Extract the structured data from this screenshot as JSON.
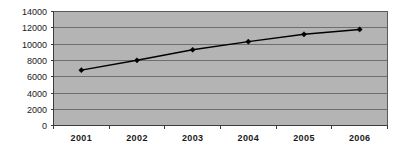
{
  "chart_data": {
    "type": "line",
    "title": "",
    "subtitle": "",
    "xlabel": "",
    "ylabel": "",
    "categories": [
      "2001",
      "2002",
      "2003",
      "2004",
      "2005",
      "2006"
    ],
    "values": [
      6800,
      8000,
      9300,
      10300,
      11200,
      11800
    ],
    "series": [
      {
        "name": "",
        "values": [
          6800,
          8000,
          9300,
          10300,
          11200,
          11800
        ]
      }
    ],
    "ylim": [
      0,
      14000
    ],
    "ytick_labels": [
      "0",
      "2000",
      "4000",
      "6000",
      "8000",
      "10000",
      "12000",
      "14000"
    ],
    "ytick_values": [
      0,
      2000,
      4000,
      6000,
      8000,
      10000,
      12000,
      14000
    ],
    "xtick_labels": [
      "2001",
      "2002",
      "2003",
      "2004",
      "2005",
      "2006"
    ],
    "grid": true,
    "grid_orientation": "horizontal",
    "legend": false,
    "legend_position": "none",
    "marker": "diamond",
    "colors": {
      "line": "#000000",
      "marker": "#000000",
      "plot_background": "#b4b4b4",
      "figure_background": "#ffffff",
      "gridline": "#6e6e6e",
      "axis": "#3c3c3c",
      "text": "#1a1a1a"
    }
  }
}
